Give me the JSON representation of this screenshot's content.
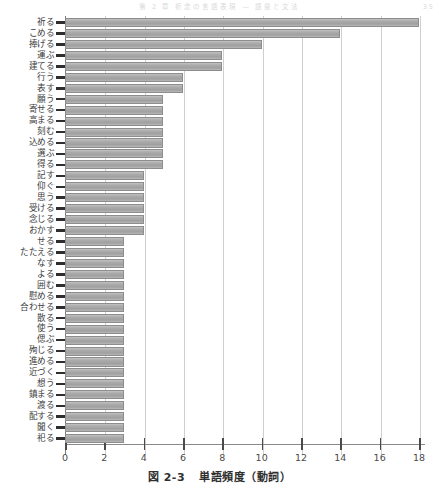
{
  "page_header": {
    "text": "第 2 章   祈念の言語表現 — 語彙と文法",
    "page_number": "35"
  },
  "caption": {
    "figure_number": "図 2-3",
    "title": "単語頻度（動詞）"
  },
  "chart_data": {
    "type": "bar",
    "orientation": "horizontal",
    "title": "単語頻度（動詞）",
    "xlabel": "",
    "ylabel": "",
    "xlim": [
      0,
      18
    ],
    "xticks": [
      0,
      2,
      4,
      6,
      8,
      10,
      12,
      14,
      16,
      18
    ],
    "xtick_labels": [
      "0",
      "2",
      "4",
      "6",
      "8",
      "10",
      "12",
      "14",
      "16",
      "18"
    ],
    "grid": "vertical",
    "legend": "none",
    "bar_color": "#a8a8a8",
    "bar_edge_color": "#8d8d8d",
    "categories": [
      "祈る",
      "こめる",
      "捧げる",
      "運ぶ",
      "建てる",
      "行う",
      "表す",
      "願う",
      "寄せる",
      "高まる",
      "刻む",
      "込める",
      "選ぶ",
      "得る",
      "記す",
      "仰ぐ",
      "思う",
      "受ける",
      "念じる",
      "おかす",
      "せる",
      "たたえる",
      "なす",
      "よる",
      "囲む",
      "慰める",
      "合わせる",
      "散る",
      "使う",
      "偲ぶ",
      "殉じる",
      "進める",
      "近づく",
      "想う",
      "鎮まる",
      "渡る",
      "配する",
      "聞く",
      "祀る"
    ],
    "values": [
      18,
      14,
      10,
      8,
      8,
      6,
      6,
      5,
      5,
      5,
      5,
      5,
      5,
      5,
      4,
      4,
      4,
      4,
      4,
      4,
      3,
      3,
      3,
      3,
      3,
      3,
      3,
      3,
      3,
      3,
      3,
      3,
      3,
      3,
      3,
      3,
      3,
      3,
      3
    ]
  }
}
